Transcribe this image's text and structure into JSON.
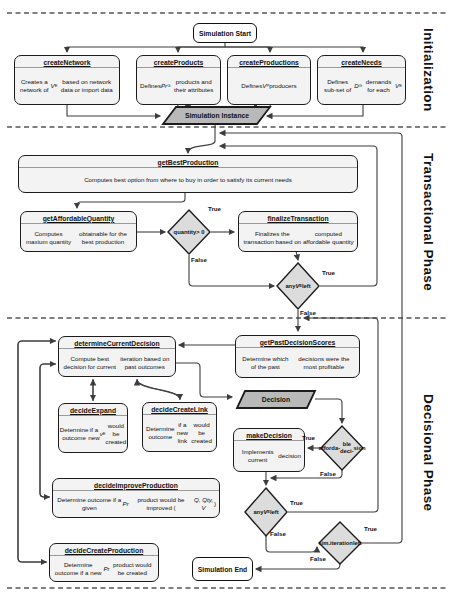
{
  "phase_labels": {
    "initialization": "Initialization",
    "transactional": "Transactional Phase",
    "decisional": "Decisional Phase"
  },
  "nodes": {
    "simulation_start": {
      "label": "Simulation Start"
    },
    "create_network": {
      "title": "createNetwork",
      "body": [
        {
          "t": "Creates a network of "
        },
        {
          "t": "V",
          "i": true
        },
        {
          "t": "E",
          "sub": true
        },
        {
          "t": " based on network data or import data"
        }
      ]
    },
    "create_products": {
      "title": "createProducts",
      "body": [
        {
          "t": "Defines "
        },
        {
          "t": "Pr",
          "i": true
        },
        {
          "t": "G",
          "sub": true
        },
        {
          "t": " products and their attributes"
        }
      ]
    },
    "create_productions": {
      "title": "createProductions",
      "body": [
        {
          "t": "Defines "
        },
        {
          "t": "V",
          "i": true
        },
        {
          "t": "P",
          "sub": true
        },
        {
          "t": " producers"
        }
      ]
    },
    "create_needs": {
      "title": "createNeeds",
      "body": [
        {
          "t": "Defines sub-set of "
        },
        {
          "t": "D",
          "i": true
        },
        {
          "t": "G",
          "sub": true
        },
        {
          "t": " demands for each "
        },
        {
          "t": "V",
          "i": true
        },
        {
          "t": "E",
          "sub": true
        }
      ]
    },
    "simulation_instance": {
      "label": "Simulation Instance"
    },
    "get_best_production": {
      "title": "getBestProduction",
      "body": [
        {
          "t": "Computes best option from where to buy in order to satisfy its current needs"
        }
      ]
    },
    "get_affordable_quantity": {
      "title": "getAffordableQuantity",
      "body": [
        {
          "t": "Computes maxium quantity"
        },
        {
          "br": true
        },
        {
          "t": "obtainable for the best production"
        }
      ]
    },
    "quantity_decision": {
      "text": [
        {
          "t": "quantity"
        },
        {
          "br": true
        },
        {
          "t": "> 0"
        }
      ]
    },
    "finalize_transaction": {
      "title": "finalizeTransaction",
      "body": [
        {
          "t": "Finalizes the transaction based on"
        },
        {
          "br": true
        },
        {
          "t": "computed affordable quantity"
        }
      ]
    },
    "any_ve_left_trans": {
      "text": [
        {
          "t": "any"
        },
        {
          "br": true
        },
        {
          "t": "V",
          "i": true
        },
        {
          "t": "E",
          "sub": true
        },
        {
          "br": true
        },
        {
          "t": "left"
        }
      ]
    },
    "determine_current_decision": {
      "title": "determineCurrentDecision",
      "body": [
        {
          "t": "Compute best decision for current"
        },
        {
          "br": true
        },
        {
          "t": "iteration based on past outcomes"
        }
      ]
    },
    "get_past_decision_scores": {
      "title": "getPastDecisionScores",
      "body": [
        {
          "t": "Determine which of the past"
        },
        {
          "br": true
        },
        {
          "t": "decisions were the most profitable"
        }
      ]
    },
    "decide_expand": {
      "title": "decideExpand",
      "body": [
        {
          "t": "Determine outcome"
        },
        {
          "br": true
        },
        {
          "t": "if a new "
        },
        {
          "t": "v",
          "i": true
        },
        {
          "t": "E",
          "sub": true
        },
        {
          "br": true
        },
        {
          "t": "would be created"
        }
      ]
    },
    "decide_create_link": {
      "title": "decideCreateLink",
      "body": [
        {
          "t": "Determine outcome"
        },
        {
          "br": true
        },
        {
          "t": "if a new link"
        },
        {
          "br": true
        },
        {
          "t": "would be created"
        }
      ]
    },
    "decision_output": {
      "label": "Decision"
    },
    "make_decision": {
      "title": "makeDecision",
      "body": [
        {
          "t": "Implements current"
        },
        {
          "br": true
        },
        {
          "t": "decision"
        }
      ]
    },
    "affordable_decision": {
      "text": [
        {
          "t": "afforda-"
        },
        {
          "br": true
        },
        {
          "t": "ble deci-"
        },
        {
          "br": true
        },
        {
          "t": "sion"
        }
      ]
    },
    "decide_improve_production": {
      "title": "decideImproveProduction",
      "body": [
        {
          "t": "Determine outcome if a given "
        },
        {
          "t": "Pr",
          "i": true
        },
        {
          "br": true
        },
        {
          "t": "product would be improved ("
        },
        {
          "t": "Q, Qty, V",
          "i": true
        },
        {
          "t": ")"
        }
      ]
    },
    "any_ve_left_dec": {
      "text": [
        {
          "t": "any"
        },
        {
          "br": true
        },
        {
          "t": "V",
          "i": true
        },
        {
          "t": "E",
          "sub": true
        },
        {
          "br": true
        },
        {
          "t": "left"
        }
      ]
    },
    "sim_iteration_left": {
      "text": [
        {
          "t": "sim."
        },
        {
          "br": true
        },
        {
          "t": "iteration"
        },
        {
          "br": true
        },
        {
          "t": "left"
        }
      ]
    },
    "decide_create_production": {
      "title": "decideCreateProduction",
      "body": [
        {
          "t": "Determine outcome if a new"
        },
        {
          "br": true
        },
        {
          "t": "Pr",
          "i": true
        },
        {
          "t": " product would be created"
        }
      ]
    },
    "simulation_end": {
      "label": "Simulation End"
    }
  },
  "edge_labels": {
    "quantity_true": "True",
    "quantity_false": "False",
    "trans_any_true": "True",
    "trans_any_false": "False",
    "afford_true": "True",
    "afford_false": "False",
    "dec_any_true": "True",
    "dec_any_false": "False",
    "sim_iter_true": "True",
    "sim_iter_false": "False"
  },
  "colors": {
    "node_fill": "#f3f3f3",
    "terminal_fill": "#ffffff",
    "diamond_fill": "#dcdcdc",
    "io_fill": "#b9b9b9",
    "border": "#1c1c1c",
    "connector": "#3d3d3d"
  }
}
